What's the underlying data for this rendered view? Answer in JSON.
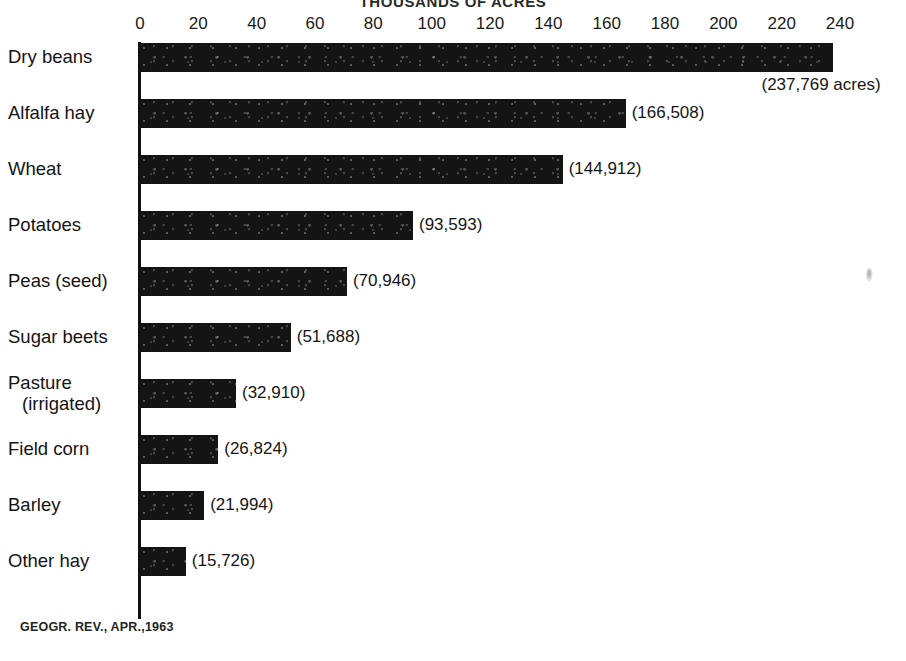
{
  "chart_data": {
    "type": "bar",
    "orientation": "horizontal",
    "title": "THOUSANDS OF ACRES",
    "xlabel": "",
    "ylabel": "",
    "xlim": [
      0,
      240
    ],
    "grid": false,
    "legend": null,
    "tick_labels": [
      "0",
      "20",
      "40",
      "60",
      "80",
      "100",
      "120",
      "140",
      "160",
      "180",
      "200",
      "220",
      "240"
    ],
    "tick_values": [
      0,
      20,
      40,
      60,
      80,
      100,
      120,
      140,
      160,
      180,
      200,
      220,
      240
    ],
    "categories": [
      "Dry beans",
      "Alfalfa hay",
      "Wheat",
      "Potatoes",
      "Peas (seed)",
      "Sugar beets",
      "Pasture (irrigated)",
      "Field corn",
      "Barley",
      "Other hay"
    ],
    "values": [
      237.769,
      166.508,
      144.912,
      93.593,
      70.946,
      51.688,
      32.91,
      26.824,
      21.994,
      15.726
    ],
    "units": "thousands of acres",
    "data_labels": [
      "(237,769 acres)",
      "(166,508)",
      "(144,912)",
      "(93,593)",
      "(70,946)",
      "(51,688)",
      "(32,910)",
      "(26,824)",
      "(21,994)",
      "(15,726)"
    ],
    "bar_color": "#141414",
    "source": "GEOGR. REV., APR.,1963"
  },
  "rows": [
    {
      "label": "Dry beans",
      "label_line2": "",
      "value": 237.769,
      "data_label": "(237,769 acres)",
      "label_below": true
    },
    {
      "label": "Alfalfa hay",
      "label_line2": "",
      "value": 166.508,
      "data_label": "(166,508)",
      "label_below": false
    },
    {
      "label": "Wheat",
      "label_line2": "",
      "value": 144.912,
      "data_label": "(144,912)",
      "label_below": false
    },
    {
      "label": "Potatoes",
      "label_line2": "",
      "value": 93.593,
      "data_label": "(93,593)",
      "label_below": false
    },
    {
      "label": "Peas (seed)",
      "label_line2": "",
      "value": 70.946,
      "data_label": "(70,946)",
      "label_below": false
    },
    {
      "label": "Sugar beets",
      "label_line2": "",
      "value": 51.688,
      "data_label": "(51,688)",
      "label_below": false
    },
    {
      "label": "Pasture",
      "label_line2": "(irrigated)",
      "value": 32.91,
      "data_label": "(32,910)",
      "label_below": false
    },
    {
      "label": "Field corn",
      "label_line2": "",
      "value": 26.824,
      "data_label": "(26,824)",
      "label_below": false
    },
    {
      "label": "Barley",
      "label_line2": "",
      "value": 21.994,
      "data_label": "(21,994)",
      "label_below": false
    },
    {
      "label": "Other hay",
      "label_line2": "",
      "value": 15.726,
      "data_label": "(15,726)",
      "label_below": false
    }
  ],
  "source_credit": "GEOGR. REV., APR.,1963"
}
